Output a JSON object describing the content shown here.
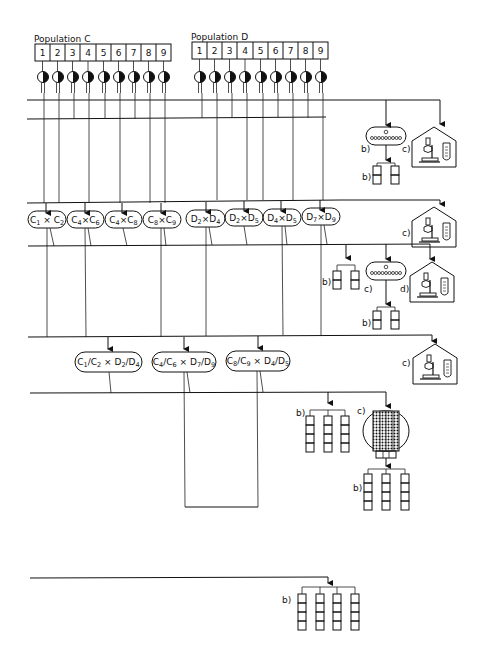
{
  "populations": [
    {
      "label": "Population  C",
      "id": "C",
      "individuals": [
        "1",
        "2",
        "3",
        "4",
        "5",
        "6",
        "7",
        "8",
        "9"
      ]
    },
    {
      "label": "Population  D",
      "id": "D",
      "individuals": [
        "1",
        "2",
        "3",
        "4",
        "5",
        "6",
        "7",
        "8",
        "9"
      ]
    }
  ],
  "single_crosses": [
    {
      "p1": "C",
      "s1": "1",
      "p2": "C",
      "s2": "2"
    },
    {
      "p1": "C",
      "s1": "4",
      "p2": "C",
      "s2": "6"
    },
    {
      "p1": "C",
      "s1": "4",
      "p2": "C",
      "s2": "8"
    },
    {
      "p1": "C",
      "s1": "8",
      "p2": "C",
      "s2": "9"
    },
    {
      "p1": "D",
      "s1": "2",
      "p2": "D",
      "s2": "4"
    },
    {
      "p1": "D",
      "s1": "2",
      "p2": "D",
      "s2": "5"
    },
    {
      "p1": "D",
      "s1": "4",
      "p2": "D",
      "s2": "5"
    },
    {
      "p1": "D",
      "s1": "7",
      "p2": "D",
      "s2": "9"
    }
  ],
  "double_crosses": [
    {
      "a": "C",
      "a1": "1",
      "b": "C",
      "b1": "2",
      "c": "D",
      "c1": "2",
      "d": "D",
      "d1": "4"
    },
    {
      "a": "C",
      "a1": "4",
      "b": "C",
      "b1": "6",
      "c": "D",
      "c1": "7",
      "d": "D",
      "d1": "9"
    },
    {
      "a": "C",
      "a1": "8",
      "b": "C",
      "b1": "9",
      "c": "D",
      "c1": "4",
      "d": "D",
      "d1": "5"
    }
  ],
  "symbols": {
    "cross": "×",
    "slash": "/"
  },
  "step_labels": {
    "b": "b)",
    "c": "c)",
    "d": "d)"
  },
  "icons": [
    "half-filled-circle-plant-icon",
    "isolation-plot-icon",
    "plot-row-icon",
    "laboratory-microscope-icon",
    "test-tube-icon",
    "seed-chamber-icon"
  ]
}
